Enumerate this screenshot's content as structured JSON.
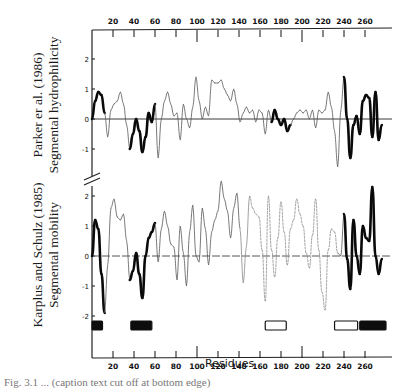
{
  "figure": {
    "top_panel_label_line1": "Parker er al. (1986)",
    "top_panel_label_line2": "Segmental hydrophilicity",
    "bottom_panel_label_line1": "Karplus and Schulz (1985)",
    "bottom_panel_label_line2": "Segmental mobility",
    "x_axis_title": "Residues",
    "caption_fragment": "Fig. 3.1 ... (caption text cut off at bottom edge)"
  },
  "chart_data": [
    {
      "type": "line",
      "title": "Segmental hydrophilicity",
      "ylabel": "Parker er al. (1986) Segmental hydrophilicity",
      "xlabel": "Residues",
      "xlim": [
        0,
        285
      ],
      "ylim": [
        -1.8,
        2.5
      ],
      "yticks": [
        -1,
        0,
        1,
        2
      ],
      "xticks": [
        20,
        40,
        60,
        80,
        100,
        120,
        140,
        160,
        180,
        200,
        220,
        240,
        260
      ],
      "grid": false,
      "baseline": 0,
      "series": [
        {
          "name": "hydrophilicity",
          "x": [
            0,
            3,
            6,
            9,
            12,
            15,
            18,
            21,
            24,
            27,
            30,
            33,
            36,
            39,
            42,
            45,
            48,
            51,
            54,
            57,
            60,
            63,
            66,
            69,
            72,
            75,
            78,
            81,
            84,
            87,
            90,
            93,
            96,
            99,
            102,
            105,
            108,
            111,
            114,
            117,
            120,
            123,
            126,
            129,
            132,
            135,
            138,
            141,
            144,
            147,
            150,
            153,
            156,
            159,
            162,
            165,
            168,
            171,
            174,
            177,
            180,
            183,
            186,
            189,
            192,
            195,
            198,
            201,
            204,
            207,
            210,
            213,
            216,
            219,
            222,
            225,
            228,
            231,
            234,
            237,
            240,
            243,
            246,
            249,
            252,
            255,
            258,
            261,
            264,
            267,
            270,
            273,
            276
          ],
          "values": [
            0.0,
            0.6,
            0.9,
            0.8,
            0.2,
            -0.6,
            0.3,
            0.5,
            0.6,
            0.9,
            0.5,
            -0.2,
            -1.0,
            -0.5,
            0.0,
            -0.4,
            -1.1,
            -0.6,
            0.2,
            -0.1,
            0.5,
            -1.3,
            0.0,
            0.6,
            0.9,
            0.5,
            0.1,
            0.2,
            -0.7,
            0.5,
            0.0,
            -0.3,
            0.4,
            1.4,
            0.6,
            0.0,
            0.4,
            0.1,
            1.3,
            1.2,
            1.2,
            1.3,
            1.0,
            0.8,
            0.6,
            1.0,
            0.5,
            -0.1,
            0.2,
            0.4,
            0.2,
            0.3,
            -0.1,
            0.3,
            0.2,
            -0.5,
            0.3,
            -0.1,
            0.3,
            0.0,
            -0.2,
            0.0,
            -0.4,
            -0.2,
            0.0,
            0.2,
            0.3,
            0.2,
            0.3,
            0.0,
            0.3,
            -0.3,
            0.3,
            0.2,
            0.3,
            0.9,
            0.4,
            -0.4,
            -1.6,
            0.3,
            1.4,
            0.0,
            -1.3,
            -0.2,
            0.1,
            -0.5,
            0.6,
            0.8,
            0.7,
            -0.6,
            0.9,
            -0.7,
            -0.2
          ]
        }
      ]
    },
    {
      "type": "line",
      "title": "Segmental mobility",
      "ylabel": "Karplus and Schulz (1985) Segmental mobility",
      "xlabel": "Residues",
      "xlim": [
        0,
        285
      ],
      "ylim": [
        -2.5,
        2.8
      ],
      "yticks": [
        -2,
        -1,
        0,
        1,
        2
      ],
      "xticks": [
        20,
        40,
        60,
        80,
        100,
        120,
        140,
        160,
        180,
        200,
        220,
        240,
        260
      ],
      "grid": false,
      "baseline": 0,
      "series": [
        {
          "name": "mobility",
          "x": [
            0,
            3,
            6,
            9,
            12,
            15,
            18,
            21,
            24,
            27,
            30,
            33,
            36,
            39,
            42,
            45,
            48,
            51,
            54,
            57,
            60,
            63,
            66,
            69,
            72,
            75,
            78,
            81,
            84,
            87,
            90,
            93,
            96,
            99,
            102,
            105,
            108,
            111,
            114,
            117,
            120,
            123,
            126,
            129,
            132,
            135,
            138,
            141,
            144,
            147,
            150,
            153,
            156,
            159,
            162,
            165,
            168,
            171,
            174,
            177,
            180,
            183,
            186,
            189,
            192,
            195,
            198,
            201,
            204,
            207,
            210,
            213,
            216,
            219,
            222,
            225,
            228,
            231,
            234,
            237,
            240,
            243,
            246,
            249,
            252,
            255,
            258,
            261,
            264,
            267,
            270,
            273,
            276
          ],
          "values": [
            0.0,
            1.2,
            0.9,
            -0.6,
            -1.9,
            -0.3,
            1.6,
            1.9,
            1.3,
            1.2,
            1.4,
            0.5,
            -0.8,
            -0.5,
            0.1,
            -0.6,
            -1.4,
            0.0,
            0.6,
            0.8,
            1.1,
            -0.2,
            0.9,
            1.5,
            1.0,
            0.4,
            0.3,
            -0.8,
            1.0,
            0.1,
            -1.0,
            0.8,
            1.7,
            0.0,
            -0.2,
            1.6,
            0.9,
            -0.3,
            0.8,
            1.2,
            1.5,
            2.5,
            1.9,
            1.5,
            0.6,
            1.6,
            2.1,
            0.9,
            -0.9,
            0.3,
            2.0,
            1.6,
            1.4,
            1.3,
            0.2,
            -1.5,
            2.0,
            0.2,
            -0.7,
            0.6,
            1.8,
            0.8,
            -0.3,
            0.9,
            1.2,
            1.9,
            1.4,
            1.0,
            0.1,
            -0.4,
            0.7,
            1.9,
            0.2,
            -1.2,
            -1.8,
            0.2,
            0.9,
            0.8,
            0.1,
            0.0,
            1.4,
            -0.1,
            -1.1,
            1.2,
            0.0,
            -0.6,
            1.0,
            0.6,
            0.5,
            2.3,
            0.0,
            -0.6,
            -0.1
          ]
        }
      ]
    }
  ],
  "secondary_structure_bars": [
    {
      "start": 0,
      "end": 10,
      "style": "filled"
    },
    {
      "start": 37,
      "end": 57,
      "style": "filled"
    },
    {
      "start": 165,
      "end": 185,
      "style": "open"
    },
    {
      "start": 231,
      "end": 253,
      "style": "open"
    },
    {
      "start": 255,
      "end": 280,
      "style": "filled"
    }
  ],
  "colors": {
    "ink": "#111111",
    "background": "#ffffff",
    "faint_line": "#555555"
  }
}
